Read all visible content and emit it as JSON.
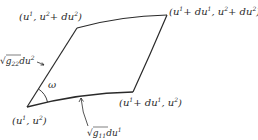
{
  "diagram": {
    "vertices": [
      {
        "id": "A",
        "label": "(u¹, u²)",
        "x": 27,
        "y": 107
      },
      {
        "id": "B",
        "label": "(u¹+du¹, u²)",
        "x": 133,
        "y": 92
      },
      {
        "id": "C",
        "label": "(u¹+du¹, u²+du²)",
        "x": 167,
        "y": 15
      },
      {
        "id": "D",
        "label": "(u¹, u²+du²)",
        "x": 77,
        "y": 28
      }
    ],
    "edge_labels": {
      "left": "√g₂₂du²",
      "bottom": "√g₁₁du¹"
    },
    "angle_label": "ω",
    "labels": {
      "a_base": "(u",
      "a_sup1": "1",
      "a_mid": ", u",
      "a_sup2": "2",
      "a_end": ")",
      "b_base": "(u",
      "b_sup1": "1",
      "b_mid": "+ du",
      "b_sup2": "1",
      "b_mid2": ", u",
      "b_sup3": "2",
      "b_end": ")",
      "c_base": "(u",
      "c_sup1": "1",
      "c_mid": "+ du",
      "c_sup2": "1",
      "c_mid2": ", u",
      "c_sup3": "2",
      "c_mid3": "+ du",
      "c_sup4": "2",
      "c_end": ")",
      "d_base": "(u",
      "d_sup1": "1",
      "d_mid": ", u",
      "d_sup2": "2",
      "d_mid2": "+ du",
      "d_sup3": "2",
      "d_end": ")",
      "g22_sqrt": "√",
      "g22_g": "g",
      "g22_sub": "22",
      "g22_du": "du",
      "g22_sup": "2",
      "g11_sqrt": "√",
      "g11_g": "g",
      "g11_sub": "11",
      "g11_du": "du",
      "g11_sup": "1",
      "omega": "ω"
    },
    "colors": {
      "stroke": "#2a2a2a",
      "background": "#ffffff"
    }
  }
}
